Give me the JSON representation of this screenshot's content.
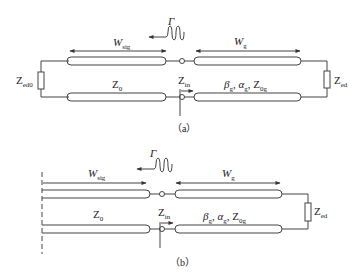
{
  "figure_a": {
    "caption": "（a）",
    "labels": {
      "w_sig": {
        "main": "W",
        "sub": "sig"
      },
      "w_g": {
        "main": "W",
        "sub": "g"
      },
      "gamma": "Γ",
      "z_ed0": {
        "main": "Z",
        "sub": "ed0"
      },
      "z_0": {
        "main": "Z",
        "sub": "0"
      },
      "z_in": {
        "main": "Z",
        "sub": "in"
      },
      "params": {
        "b": "β",
        "bs": "g",
        "a": "α",
        "as": "g",
        "z": "Z",
        "zs": "0g"
      },
      "z_ed": {
        "main": "Z",
        "sub": "ed"
      }
    }
  },
  "figure_b": {
    "caption": "（b）",
    "labels": {
      "w_sig": {
        "main": "W",
        "sub": "sig"
      },
      "w_g": {
        "main": "W",
        "sub": "g"
      },
      "gamma": "Γ",
      "z_0": {
        "main": "Z",
        "sub": "0"
      },
      "z_in": {
        "main": "Z",
        "sub": "in"
      },
      "params": {
        "b": "β",
        "bs": "g",
        "a": "α",
        "as": "g",
        "z": "Z",
        "zs": "0g"
      },
      "z_ed": {
        "main": "Z",
        "sub": "ed"
      }
    }
  },
  "colors": {
    "stroke": "#333333",
    "text": "#222222"
  }
}
